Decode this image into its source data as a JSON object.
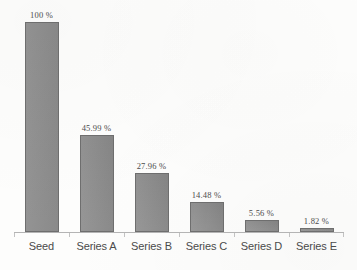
{
  "chart_data": {
    "type": "bar",
    "title": "",
    "xlabel": "",
    "ylabel": "",
    "ylim": [
      0,
      100
    ],
    "grid": false,
    "legend": "none",
    "categories": [
      "Seed",
      "Series A",
      "Series B",
      "Series C",
      "Series D",
      "Series E"
    ],
    "values": [
      100,
      45.99,
      27.96,
      14.48,
      5.56,
      1.82
    ],
    "value_labels": [
      "100 %",
      "45.99 %",
      "27.96 %",
      "14.48 %",
      "5.56 %",
      "1.82 %"
    ],
    "units": "percent"
  },
  "style": {
    "bar_fill": "#8d8d8d",
    "bar_border": "#6e6e6e",
    "axis_color": "#b4b4b4",
    "tick_color": "#c2c2c2",
    "value_text_color": "#3b3b3b",
    "category_text_color": "#4a4a4a",
    "background": "#fdfdfc"
  }
}
